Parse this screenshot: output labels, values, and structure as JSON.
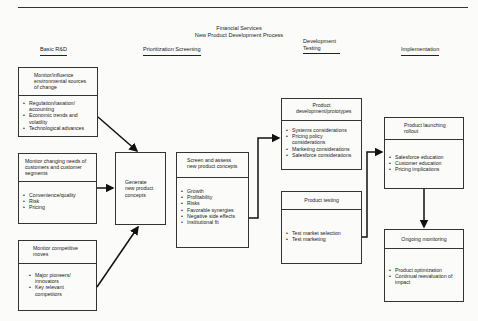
{
  "title": {
    "line1": "Financial Services",
    "line2": "New Product Development Process"
  },
  "phases": [
    {
      "label": "Basic R&D"
    },
    {
      "label": "Prioritization Screening"
    },
    {
      "label": "Development Testing"
    },
    {
      "label": "Implementation"
    }
  ],
  "boxes": {
    "environment": {
      "header": "Monitor/influence environmental sources of change",
      "items": [
        "Regulation/taxation/ accounting",
        "Economic trends and volatility",
        "Technological advances"
      ]
    },
    "customers": {
      "header": "Monitor changing needs of customers and customer segments",
      "items": [
        "Convenience/quality",
        "Risk",
        "Pricing"
      ]
    },
    "competitive": {
      "header": "Monitor competitive moves",
      "items": [
        "Major pioneers/ innovators",
        "Key relevant competitors"
      ]
    },
    "generate": {
      "header": "Generate new product concepts"
    },
    "screen": {
      "header": "Screen and assess new product concepts",
      "items": [
        "Growth",
        "Profitability",
        "Risks",
        "Favorable synergies",
        "Negative side effects",
        "Institutional fit"
      ]
    },
    "prototypes": {
      "header": "Product development/prototypes",
      "items": [
        "Systems considerations",
        "Pricing policy considerations",
        "Marketing considerations",
        "Salesforce considerations"
      ]
    },
    "testing": {
      "header": "Product testing",
      "items": [
        "Test market selection",
        "Test marketing"
      ]
    },
    "launching": {
      "header": "Product launching rollout",
      "items": [
        "Salesforce education",
        "Customer education",
        "Pricing implications"
      ]
    },
    "monitoring": {
      "header": "Ongoing monitoring",
      "items": [
        "Product optimization",
        "Continual reevaluation of impact"
      ]
    }
  }
}
